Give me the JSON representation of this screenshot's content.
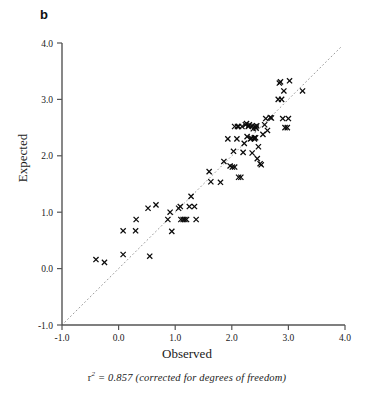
{
  "panel": {
    "label": "b"
  },
  "axes": {
    "xlabel": "Observed",
    "ylabel": "Expected",
    "xticks": [
      "-1.0",
      "0.0",
      "1.0",
      "2.0",
      "3.0",
      "4.0"
    ],
    "yticks": [
      "4.0",
      "3.0",
      "2.0",
      "1.0",
      "0.0",
      "-1.0"
    ],
    "xlim": [
      -1.0,
      4.0
    ],
    "ylim": [
      -1.0,
      4.0
    ]
  },
  "caption": {
    "symbol": "r",
    "exponent": "2",
    "text": "= 0.857 (corrected for degrees of freedom)",
    "full": "r2 = 0.857 (corrected for degrees of freedom)"
  },
  "colors": {
    "axis": "#555555",
    "marker": "#0a0a0a",
    "reference_line": "#9a9a9a",
    "text": "#1a1a1a"
  },
  "chart_data": {
    "type": "scatter",
    "title": "",
    "xlabel": "Observed",
    "ylabel": "Expected",
    "xlim": [
      -1.0,
      4.0
    ],
    "ylim": [
      -1.0,
      4.0
    ],
    "grid": false,
    "legend": null,
    "marker": "x",
    "r_squared": 0.857,
    "annotation": "r2 = 0.857 (corrected for degrees of freedom)",
    "reference_line": {
      "type": "identity",
      "style": "dotted",
      "from": [
        -1.0,
        -1.0
      ],
      "to": [
        3.92,
        3.92
      ]
    },
    "points": [
      [
        -0.4,
        0.16
      ],
      [
        -0.25,
        0.11
      ],
      [
        0.08,
        0.25
      ],
      [
        0.08,
        0.67
      ],
      [
        0.3,
        0.67
      ],
      [
        0.31,
        0.87
      ],
      [
        0.52,
        1.07
      ],
      [
        0.55,
        0.22
      ],
      [
        0.66,
        1.13
      ],
      [
        0.87,
        0.87
      ],
      [
        0.91,
        1.0
      ],
      [
        0.94,
        0.66
      ],
      [
        1.06,
        1.07
      ],
      [
        1.09,
        1.1
      ],
      [
        1.1,
        0.87
      ],
      [
        1.14,
        0.87
      ],
      [
        1.17,
        0.87
      ],
      [
        1.2,
        0.87
      ],
      [
        1.25,
        1.1
      ],
      [
        1.28,
        1.28
      ],
      [
        1.34,
        1.1
      ],
      [
        1.37,
        0.87
      ],
      [
        1.6,
        1.72
      ],
      [
        1.63,
        1.54
      ],
      [
        1.8,
        1.53
      ],
      [
        1.86,
        1.9
      ],
      [
        1.93,
        2.3
      ],
      [
        1.97,
        1.82
      ],
      [
        2.01,
        1.8
      ],
      [
        2.03,
        2.08
      ],
      [
        2.05,
        1.8
      ],
      [
        2.09,
        2.3
      ],
      [
        2.1,
        2.52
      ],
      [
        2.12,
        1.62
      ],
      [
        2.16,
        1.62
      ],
      [
        2.18,
        2.52
      ],
      [
        2.2,
        2.06
      ],
      [
        2.22,
        2.22
      ],
      [
        2.24,
        2.55
      ],
      [
        2.26,
        2.57
      ],
      [
        2.27,
        2.34
      ],
      [
        2.29,
        2.52
      ],
      [
        2.31,
        2.55
      ],
      [
        2.33,
        2.3
      ],
      [
        2.35,
        2.31
      ],
      [
        2.36,
        2.05
      ],
      [
        2.38,
        2.48
      ],
      [
        2.4,
        2.3
      ],
      [
        2.41,
        2.52
      ],
      [
        2.43,
        2.49
      ],
      [
        2.45,
        1.95
      ],
      [
        2.47,
        2.16
      ],
      [
        2.5,
        1.86
      ],
      [
        2.52,
        1.84
      ],
      [
        2.55,
        2.38
      ],
      [
        2.58,
        2.55
      ],
      [
        2.6,
        2.66
      ],
      [
        2.63,
        2.45
      ],
      [
        2.68,
        2.68
      ],
      [
        2.7,
        2.67
      ],
      [
        2.82,
        3.0
      ],
      [
        2.84,
        3.29
      ],
      [
        2.86,
        3.31
      ],
      [
        2.88,
        3.0
      ],
      [
        2.9,
        2.66
      ],
      [
        2.92,
        3.15
      ],
      [
        2.94,
        2.5
      ],
      [
        2.98,
        2.5
      ],
      [
        3.02,
        3.33
      ],
      [
        3.0,
        2.66
      ],
      [
        3.25,
        3.15
      ],
      [
        2.4,
        2.32
      ],
      [
        2.42,
        2.32
      ],
      [
        2.3,
        2.53
      ],
      [
        2.36,
        2.53
      ],
      [
        2.44,
        2.53
      ],
      [
        2.05,
        2.52
      ],
      [
        2.12,
        2.52
      ]
    ]
  }
}
